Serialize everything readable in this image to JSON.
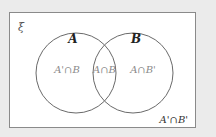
{
  "diagram": {
    "type": "venn",
    "universal_symbol": "ξ",
    "sets": [
      {
        "label": "A"
      },
      {
        "label": "B"
      }
    ],
    "regions": {
      "a_only": "A'∩B",
      "intersection": "A∩B",
      "b_only": "A∩B'",
      "outside": "A'∩B'"
    },
    "colors": {
      "background": "#ebebeb",
      "frame_fill": "#ffffff",
      "frame_stroke": "#8a8a8a",
      "circle_stroke": "#6a6a6a",
      "label_color": "#222222",
      "region_color": "#8a8a8a"
    }
  }
}
